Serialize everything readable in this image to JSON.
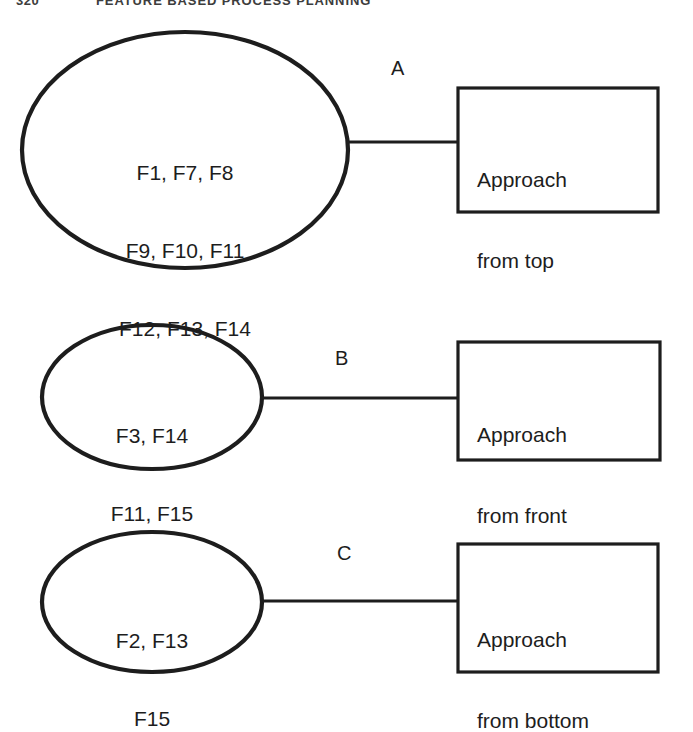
{
  "header": {
    "folio": "320",
    "title": "FEATURE BASED PROCESS PLANNING"
  },
  "diagram": {
    "type": "feature-to-approach-mapping",
    "stroke_color": "#1d1d1d",
    "background_color": "#ffffff",
    "groups": [
      {
        "id": "group-a",
        "edge_label": "A",
        "ellipse": {
          "features_line1": "F1, F7, F8",
          "features_line2": "F9, F10, F11",
          "features_line3": "F12, F13, F14",
          "cx": 185,
          "cy": 150,
          "rx": 163,
          "ry": 118
        },
        "box": {
          "line1": "Approach",
          "line2": "from top",
          "x": 458,
          "y": 88,
          "w": 200,
          "h": 124
        },
        "connector": {
          "x1": 348,
          "x2": 458,
          "y": 142
        },
        "label_pos": {
          "x": 391,
          "y": 58
        }
      },
      {
        "id": "group-b",
        "edge_label": "B",
        "ellipse": {
          "features_line1": "F3, F14",
          "features_line2": "F11, F15",
          "features_line3": "",
          "cx": 152,
          "cy": 397,
          "rx": 110,
          "ry": 72
        },
        "box": {
          "line1": "Approach",
          "line2": "from front",
          "x": 458,
          "y": 342,
          "w": 202,
          "h": 118
        },
        "connector": {
          "x1": 262,
          "x2": 458,
          "y": 398
        },
        "label_pos": {
          "x": 335,
          "y": 348
        }
      },
      {
        "id": "group-c",
        "edge_label": "C",
        "ellipse": {
          "features_line1": "F2, F13",
          "features_line2": "F15",
          "features_line3": "",
          "cx": 152,
          "cy": 602,
          "rx": 110,
          "ry": 70
        },
        "box": {
          "line1": "Approach",
          "line2": "from bottom",
          "x": 458,
          "y": 544,
          "w": 200,
          "h": 128
        },
        "connector": {
          "x1": 262,
          "x2": 458,
          "y": 601
        },
        "label_pos": {
          "x": 337,
          "y": 543
        }
      }
    ]
  }
}
